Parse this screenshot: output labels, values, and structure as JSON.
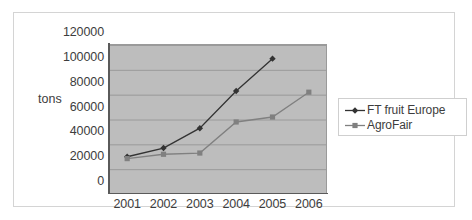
{
  "chart_data": {
    "type": "line",
    "title": "",
    "xlabel": "",
    "ylabel": "tons",
    "categories": [
      "2001",
      "2002",
      "2003",
      "2004",
      "2005",
      "2006"
    ],
    "ylim": [
      0,
      120000
    ],
    "y_ticks": [
      "0",
      "20000",
      "40000",
      "60000",
      "80000",
      "100000",
      "120000"
    ],
    "y_tick_values": [
      0,
      20000,
      40000,
      60000,
      80000,
      100000,
      120000
    ],
    "grid": true,
    "legend_position": "right",
    "series": [
      {
        "name": "FT fruit Europe",
        "marker": "diamond",
        "color": "#333333",
        "values": [
          30000,
          37000,
          53000,
          83000,
          109000,
          null
        ]
      },
      {
        "name": "AgroFair",
        "marker": "square",
        "color": "#808080",
        "values": [
          28500,
          32000,
          33000,
          58000,
          62000,
          82000
        ]
      }
    ]
  },
  "colors": {
    "plot_background": "#bdbdbd",
    "gridline": "#9a9a9a",
    "axis": "#5a5a5a",
    "frame_border": "#d4d4d4",
    "legend_border": "#cfcfcf",
    "text": "#3d3d3d"
  }
}
